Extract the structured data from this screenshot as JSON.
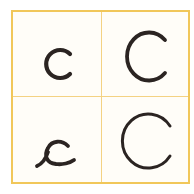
{
  "grid": {
    "border_color": "#f1c75a",
    "divider_color": "#f4d283",
    "background": "#fffdf8",
    "ink_color": "#2b2422"
  },
  "cells": [
    {
      "position": "top-left",
      "letter": "c",
      "style": "lowercase print"
    },
    {
      "position": "top-right",
      "letter": "C",
      "style": "uppercase print"
    },
    {
      "position": "bottom-left",
      "letter": "c",
      "style": "lowercase cursive"
    },
    {
      "position": "bottom-right",
      "letter": "C",
      "style": "uppercase cursive"
    }
  ]
}
